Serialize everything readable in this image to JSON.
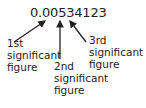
{
  "number": "0.00534123",
  "labels": [
    {
      "id": "first",
      "lines": [
        "1st",
        "significant",
        "figure"
      ]
    },
    {
      "id": "second",
      "lines": [
        "2nd",
        "significant",
        "figure"
      ]
    },
    {
      "id": "third",
      "lines": [
        "3rd",
        "significant",
        "figure"
      ]
    }
  ],
  "colors": {
    "text": "#222222",
    "arrow": "#222222",
    "background": "#ffffff"
  }
}
